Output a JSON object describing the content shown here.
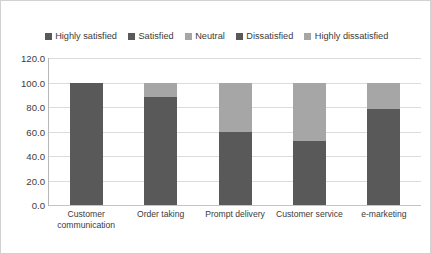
{
  "chart_data": {
    "type": "bar",
    "subtype": "stacked-column",
    "title": "",
    "xlabel": "",
    "ylabel": "",
    "ylim": [
      0,
      120
    ],
    "ytick_values": [
      120.0,
      100.0,
      80.0,
      60.0,
      40.0,
      20.0,
      0.0
    ],
    "ytick_labels": [
      "120.0",
      "100.0",
      "80.0",
      "60.0",
      "40.0",
      "20.0",
      "0.0"
    ],
    "grid": true,
    "legend_position": "top",
    "categories": [
      "Customer communication",
      "Order taking",
      "Prompt delivery",
      "Customer service",
      "e-marketing"
    ],
    "series": [
      {
        "name": "Highly satisfied",
        "color": "#595959",
        "values": [
          100,
          88,
          60,
          52,
          78
        ]
      },
      {
        "name": "Satisfied",
        "color": "#595959",
        "values": [
          0,
          0,
          0,
          0,
          0
        ]
      },
      {
        "name": "Neutral",
        "color": "#a6a6a6",
        "values": [
          0,
          12,
          34,
          48,
          22
        ]
      },
      {
        "name": "Dissatisfied",
        "color": "#595959",
        "values": [
          0,
          0,
          0,
          0,
          0
        ]
      },
      {
        "name": "Highly dissatisfied",
        "color": "#a6a6a6",
        "values": [
          0,
          0,
          6,
          0,
          0
        ]
      }
    ],
    "totals": [
      100,
      100,
      100,
      100,
      100
    ]
  },
  "legend": {
    "items": [
      {
        "label": "Highly satisfied",
        "color": "#595959"
      },
      {
        "label": "Satisfied",
        "color": "#595959"
      },
      {
        "label": "Neutral",
        "color": "#a6a6a6"
      },
      {
        "label": "Dissatisfied",
        "color": "#595959"
      },
      {
        "label": "Highly dissatisfied",
        "color": "#a6a6a6"
      }
    ]
  },
  "colors": {
    "dark": "#595959",
    "light": "#a6a6a6",
    "grid": "#dcdcdc",
    "axis": "#b8b8b8",
    "border": "#d2d2d2",
    "text": "#3b3b3b",
    "background": "#ffffff"
  }
}
